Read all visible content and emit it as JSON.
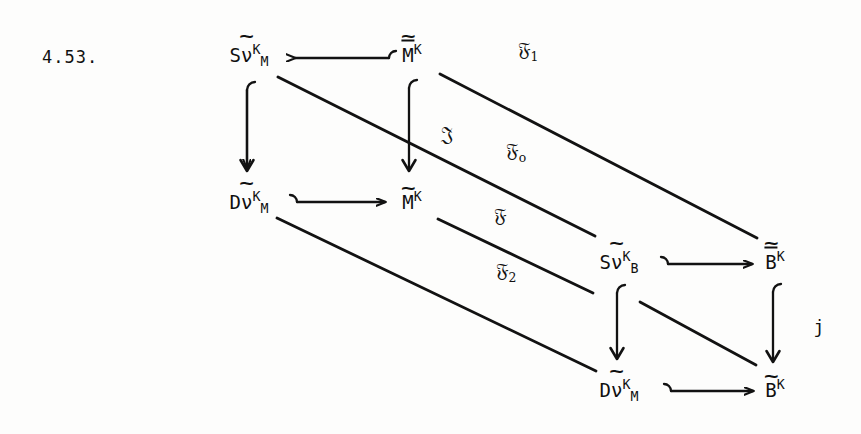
{
  "figure": {
    "number": "4.53.",
    "kind": "commutative-diagram"
  },
  "nodes": [
    {
      "id": "sv-m-top-left",
      "latex": "\\widetilde{S\\nu}^{K}_{M}",
      "base": "S",
      "accented": "ν",
      "accent": "tilde",
      "sup": "K",
      "sub": "M",
      "x": 249,
      "y": 55
    },
    {
      "id": "m-bar-top-right",
      "latex": "\\widetilde{\\overline{M}}^{K}",
      "base": "",
      "accented": "M",
      "accent": "bar-tilde",
      "sup": "K",
      "sub": "",
      "x": 412,
      "y": 55
    },
    {
      "id": "dv-m-mid-left",
      "latex": "\\widetilde{D\\nu}^{K}_{M}",
      "base": "D",
      "accented": "ν",
      "accent": "tilde",
      "sup": "K",
      "sub": "M",
      "x": 249,
      "y": 202
    },
    {
      "id": "m-tilde-center",
      "latex": "\\widetilde{M}^{K}",
      "base": "",
      "accented": "M",
      "accent": "tilde",
      "sup": "K",
      "sub": "",
      "x": 412,
      "y": 202
    },
    {
      "id": "sv-b-mid-right",
      "latex": "\\widetilde{S\\nu}^{K}_{B}",
      "base": "S",
      "accented": "ν",
      "accent": "tilde",
      "sup": "K",
      "sub": "B",
      "x": 619,
      "y": 262
    },
    {
      "id": "b-bar-tilde-right",
      "latex": "\\widetilde{\\overline{B}}^{K}",
      "base": "",
      "accented": "B",
      "accent": "bar-tilde",
      "sup": "K",
      "sub": "",
      "x": 775,
      "y": 262
    },
    {
      "id": "dv-m-bottom",
      "latex": "\\widetilde{D\\nu}^{K}_{M}",
      "base": "D",
      "accented": "ν",
      "accent": "tilde",
      "sup": "K",
      "sub": "M",
      "x": 619,
      "y": 390
    },
    {
      "id": "b-tilde-bottom-right",
      "latex": "\\widetilde{B}^{K}",
      "base": "",
      "accented": "B",
      "accent": "tilde",
      "sup": "K",
      "sub": "",
      "x": 775,
      "y": 390
    }
  ],
  "edge_labels": [
    {
      "id": "f-one",
      "glyph": "𝔉",
      "sub": "1",
      "x": 528,
      "y": 51,
      "style": "fraktur"
    },
    {
      "id": "j-frak",
      "glyph": "𝔍",
      "sub": "",
      "x": 447,
      "y": 134,
      "style": "fraktur"
    },
    {
      "id": "f-zero",
      "glyph": "𝔉",
      "sub": "o",
      "x": 516,
      "y": 152,
      "style": "fraktur"
    },
    {
      "id": "f-plain",
      "glyph": "𝔉",
      "sub": "",
      "x": 500,
      "y": 215,
      "style": "fraktur"
    },
    {
      "id": "f-two",
      "glyph": "𝔉",
      "sub": "2",
      "x": 506,
      "y": 272,
      "style": "fraktur"
    },
    {
      "id": "j-small",
      "glyph": "j",
      "sub": "",
      "x": 819,
      "y": 327,
      "style": "plain"
    }
  ],
  "arrows": [
    {
      "id": "arrow-mbar-to-svm",
      "type": "hooked-horizontal-left",
      "from": "m-bar-top-right",
      "to": "sv-m-top-left"
    },
    {
      "id": "arrow-svm-down-to-dvm",
      "type": "hooked-vertical-down",
      "from": "sv-m-top-left",
      "to": "dv-m-mid-left"
    },
    {
      "id": "arrow-mbar-down-to-m",
      "type": "hooked-vertical-down",
      "from": "m-bar-top-right",
      "to": "m-tilde-center"
    },
    {
      "id": "arrow-dvm-to-m",
      "type": "hooked-horizontal-right",
      "from": "dv-m-mid-left",
      "to": "m-tilde-center"
    },
    {
      "id": "arrow-svb-to-bbar",
      "type": "hooked-horizontal-right",
      "from": "sv-b-mid-right",
      "to": "b-bar-tilde-right"
    },
    {
      "id": "arrow-svb-down-to-dvm",
      "type": "hooked-vertical-down",
      "from": "sv-b-mid-right",
      "to": "dv-m-bottom"
    },
    {
      "id": "arrow-bbar-down-to-b",
      "type": "hooked-vertical-down",
      "from": "b-bar-tilde-right",
      "to": "b-tilde-bottom-right"
    },
    {
      "id": "arrow-dvmbottom-to-b",
      "type": "hooked-horizontal-right",
      "from": "dv-m-bottom",
      "to": "b-tilde-bottom-right"
    },
    {
      "id": "diagonal-svm-to-svb",
      "type": "diagonal",
      "from": "sv-m-top-left",
      "to": "sv-b-mid-right"
    },
    {
      "id": "diagonal-mbar-to-bbar",
      "type": "diagonal",
      "from": "m-bar-top-right",
      "to": "b-bar-tilde-right"
    },
    {
      "id": "diagonal-dvm-to-dvmbottom",
      "type": "diagonal",
      "from": "dv-m-mid-left",
      "to": "dv-m-bottom"
    },
    {
      "id": "diagonal-m-to-svb",
      "type": "diagonal",
      "from": "m-tilde-center",
      "to": "sv-b-mid-right"
    },
    {
      "id": "diagonal-svb-to-b",
      "type": "diagonal",
      "from": "sv-b-mid-right",
      "to": "b-tilde-bottom-right"
    }
  ],
  "colors": {
    "ink": "#121212",
    "paper": "#fdfdfc"
  }
}
